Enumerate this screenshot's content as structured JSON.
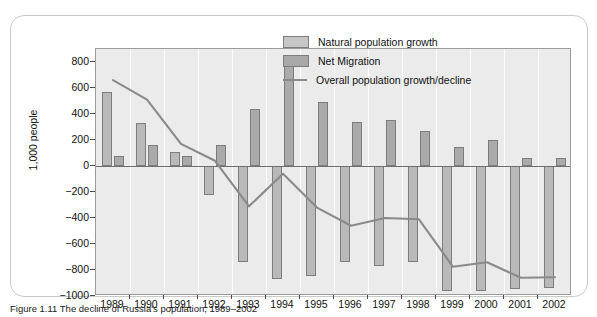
{
  "chart_data": {
    "type": "bar",
    "title": "",
    "xlabel": "",
    "ylabel": "1,000 people",
    "ylim": [
      -1000,
      900
    ],
    "ytick_values": [
      800,
      600,
      400,
      200,
      0,
      -200,
      -400,
      -600,
      -800,
      -1000
    ],
    "ytick_labels": [
      "800",
      "600",
      "400",
      "200",
      "0",
      "−200",
      "−400",
      "−600",
      "−800",
      "−1000"
    ],
    "grid": "vertical-only",
    "legend_position": "top-right-inside",
    "categories": [
      "1989",
      "1990",
      "1991",
      "1992",
      "1993",
      "1994",
      "1995",
      "1996",
      "1997",
      "1998",
      "1999",
      "2000",
      "2001",
      "2002"
    ],
    "series": [
      {
        "name": "Natural population growth",
        "kind": "bar",
        "color": "#b9b9b9",
        "values": [
          570,
          335,
          110,
          -225,
          -740,
          -870,
          -845,
          -740,
          -770,
          -735,
          -965,
          -965,
          -945,
          -935
        ]
      },
      {
        "name": "Net Migration",
        "kind": "bar",
        "color": "#aaaaaa",
        "values": [
          80,
          160,
          75,
          165,
          435,
          810,
          490,
          340,
          355,
          270,
          145,
          200,
          65,
          60
        ]
      },
      {
        "name": "Overall population growth/decline",
        "kind": "line",
        "color": "#8a8a8a",
        "values": [
          660,
          510,
          170,
          40,
          -310,
          -60,
          -320,
          -460,
          -400,
          -410,
          -775,
          -740,
          -860,
          -855
        ]
      }
    ]
  },
  "legend": {
    "items": [
      {
        "label": "Natural population growth",
        "marker": "bar-swatch"
      },
      {
        "label": "Net Migration",
        "marker": "bar-swatch"
      },
      {
        "label": "Overall population growth/decline",
        "marker": "line-swatch"
      }
    ]
  },
  "caption": {
    "text": "Figure 1.11  The decline of Russia's population, 1989–2002"
  }
}
